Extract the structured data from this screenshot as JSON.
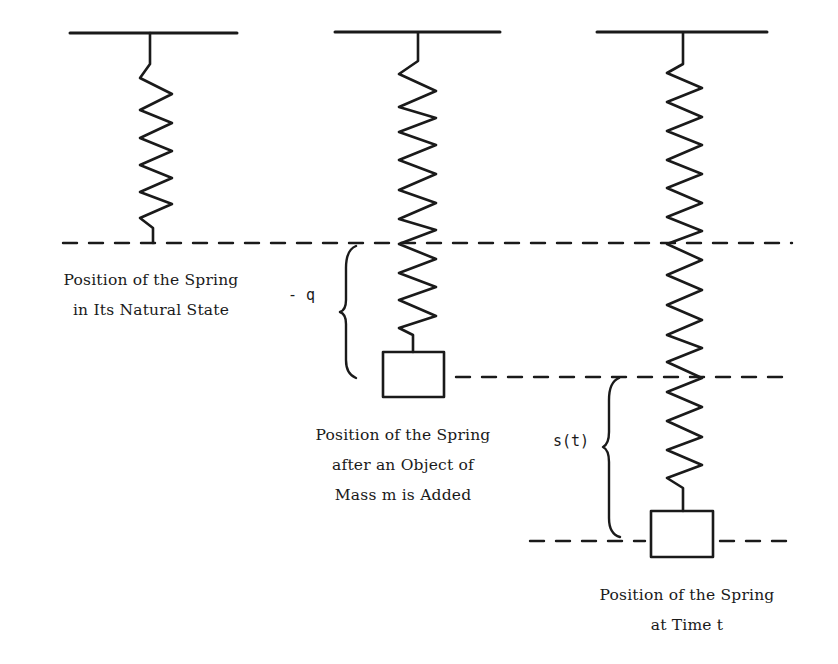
{
  "diagram": {
    "colors": {
      "ink": "#1a1a1a",
      "background": "#ffffff"
    },
    "panels": [
      {
        "id": "natural",
        "caption_lines": [
          "Position of the Spring",
          "in Its Natural State"
        ]
      },
      {
        "id": "mass-added",
        "caption_lines": [
          "Position of the Spring",
          "after an Object of",
          "Mass m is Added"
        ]
      },
      {
        "id": "time-t",
        "caption_lines": [
          "Position of the Spring",
          "at Time  t"
        ]
      }
    ],
    "braces": [
      {
        "id": "equilibrium-offset",
        "label": "- q"
      },
      {
        "id": "displacement",
        "label": "s(t)"
      }
    ]
  }
}
